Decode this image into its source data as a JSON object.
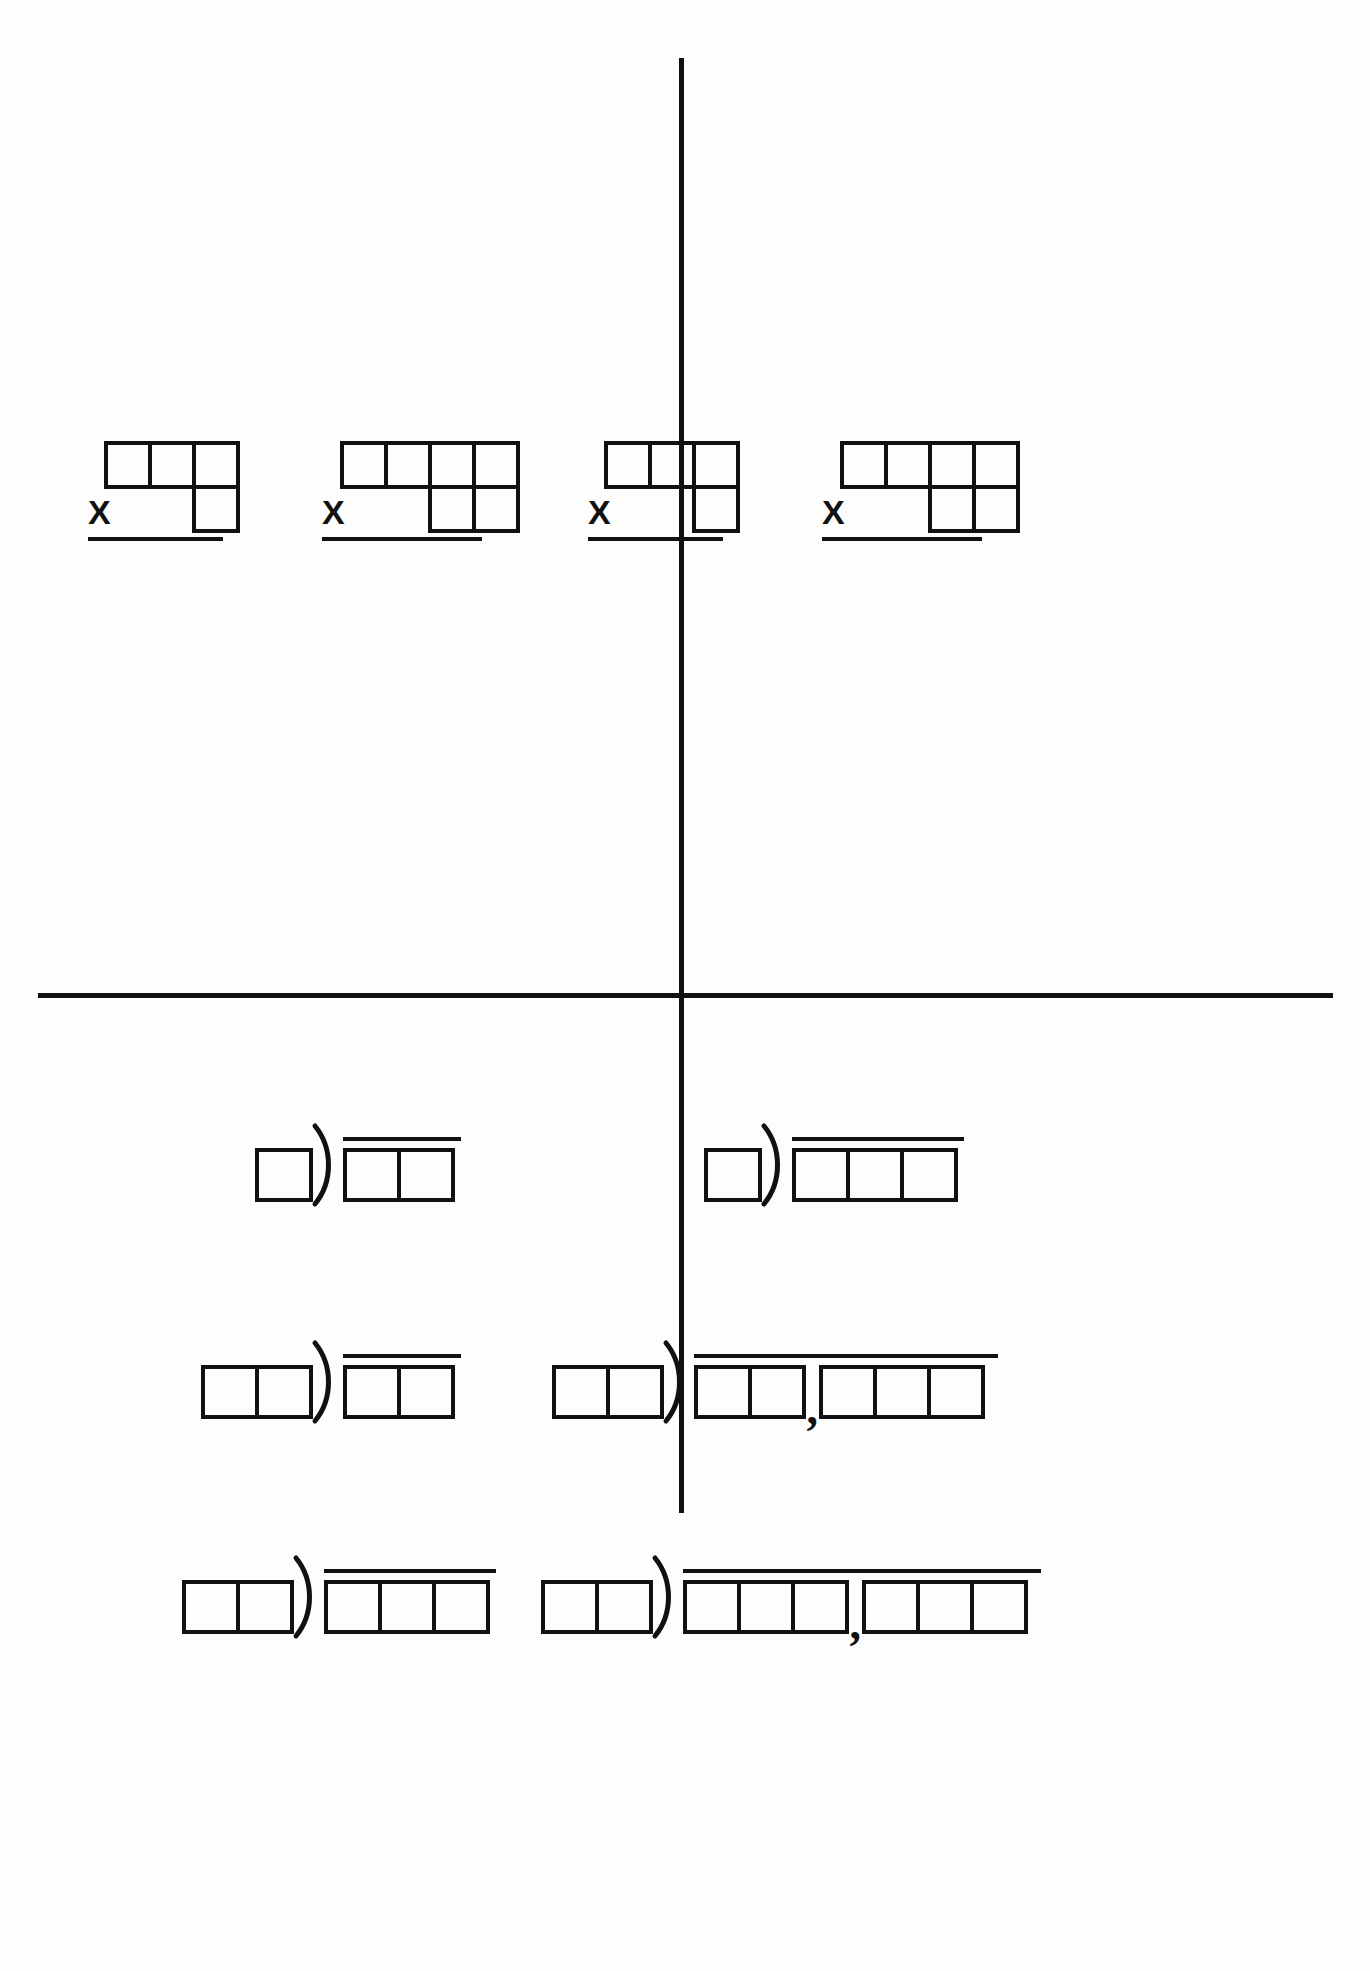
{
  "worksheet": {
    "title": "Blank Multiplication and Long Division Box Templates",
    "paper_color": "#fdfdfc",
    "ink_color": "#111111",
    "layout": "quadrant",
    "divider": {
      "vertical_x": 681,
      "horizontal_y": 995,
      "thickness": 5
    }
  },
  "multiplication_section": {
    "name": "multiplication-problems",
    "operator_symbol": "X",
    "problems": [
      {
        "id": "mult-1",
        "position": "top-left-outer",
        "top_row_boxes": 3,
        "bottom_row_boxes": 1,
        "bottom_alignment": "right",
        "operator": "X",
        "has_answer_line": true
      },
      {
        "id": "mult-2",
        "position": "top-left-inner",
        "top_row_boxes": 4,
        "bottom_row_boxes": 2,
        "bottom_alignment": "right",
        "operator": "X",
        "has_answer_line": true
      },
      {
        "id": "mult-3",
        "position": "top-right-inner",
        "top_row_boxes": 3,
        "bottom_row_boxes": 1,
        "bottom_alignment": "right",
        "operator": "X",
        "has_answer_line": true
      },
      {
        "id": "mult-4",
        "position": "top-right-outer",
        "top_row_boxes": 4,
        "bottom_row_boxes": 2,
        "bottom_alignment": "right",
        "operator": "X",
        "has_answer_line": true
      }
    ]
  },
  "division_section": {
    "name": "long-division-problems",
    "bracket_symbol": ")",
    "comma_symbol": ",",
    "problems": [
      {
        "id": "div-1",
        "row": 1,
        "column": "left",
        "divisor_boxes": 1,
        "dividend_groups": [
          2
        ],
        "has_comma": false
      },
      {
        "id": "div-2",
        "row": 1,
        "column": "right",
        "divisor_boxes": 1,
        "dividend_groups": [
          3
        ],
        "has_comma": false
      },
      {
        "id": "div-3",
        "row": 2,
        "column": "left",
        "divisor_boxes": 2,
        "dividend_groups": [
          2
        ],
        "has_comma": false
      },
      {
        "id": "div-4",
        "row": 2,
        "column": "right",
        "divisor_boxes": 2,
        "dividend_groups": [
          2,
          3
        ],
        "has_comma": true
      },
      {
        "id": "div-5",
        "row": 3,
        "column": "left",
        "divisor_boxes": 2,
        "dividend_groups": [
          3
        ],
        "has_comma": false
      },
      {
        "id": "div-6",
        "row": 3,
        "column": "right",
        "divisor_boxes": 2,
        "dividend_groups": [
          3,
          3
        ],
        "has_comma": true
      }
    ]
  }
}
